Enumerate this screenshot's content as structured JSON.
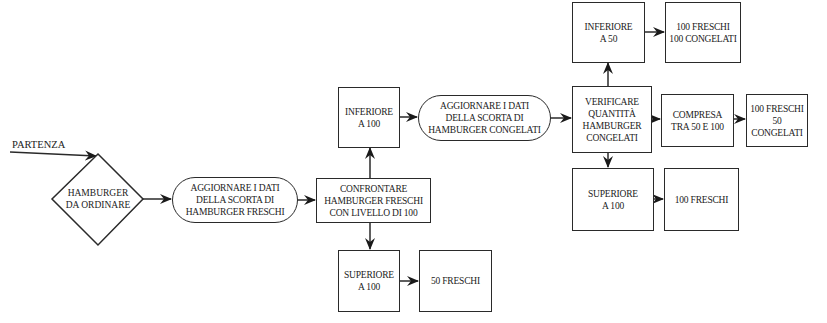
{
  "diagram": {
    "start_label": "PARTENZA",
    "nodes": {
      "decision_order": {
        "line1": "HAMBURGER",
        "line2": "DA ORDINARE"
      },
      "update_fresh": {
        "line1": "AGGIORNARE I DATI",
        "line2": "DELLA SCORTA DI",
        "line3": "HAMBURGER FRESCHI"
      },
      "compare_fresh": {
        "line1": "CONFRONTARE",
        "line2": "HAMBURGER FRESCHI",
        "line3": "CON LIVELLO DI 100"
      },
      "fresh_below_100": {
        "line1": "INFERIORE",
        "line2": "A 100"
      },
      "fresh_above_100": {
        "line1": "SUPERIORE",
        "line2": "A 100"
      },
      "order_50_fresh": {
        "line1": "50 FRESCHI"
      },
      "update_frozen": {
        "line1": "AGGIORNARE I DATI",
        "line2": "DELLA SCORTA DI",
        "line3": "HAMBURGER CONGELATI"
      },
      "check_frozen": {
        "line1": "VERIFICARE",
        "line2": "QUANTITÀ",
        "line3": "HAMBURGER",
        "line4": "CONGELATI"
      },
      "frozen_below_50": {
        "line1": "INFERIORE",
        "line2": "A 50"
      },
      "order_100f_100c": {
        "line1": "100 FRESCHI",
        "line2": "100 CONGELATI"
      },
      "frozen_between": {
        "line1": "COMPRESA",
        "line2": "TRA 50 E 100"
      },
      "order_100f_50c": {
        "line1": "100 FRESCHI",
        "line2": "50 CONGELATI"
      },
      "frozen_above_100": {
        "line1": "SUPERIORE",
        "line2": "A 100"
      },
      "order_100f": {
        "line1": "100 FRESCHI"
      }
    },
    "edges": [
      [
        "start",
        "decision_order"
      ],
      [
        "decision_order",
        "update_fresh"
      ],
      [
        "update_fresh",
        "compare_fresh"
      ],
      [
        "compare_fresh",
        "fresh_below_100"
      ],
      [
        "compare_fresh",
        "fresh_above_100"
      ],
      [
        "fresh_above_100",
        "order_50_fresh"
      ],
      [
        "fresh_below_100",
        "update_frozen"
      ],
      [
        "update_frozen",
        "check_frozen"
      ],
      [
        "check_frozen",
        "frozen_below_50"
      ],
      [
        "frozen_below_50",
        "order_100f_100c"
      ],
      [
        "check_frozen",
        "frozen_between"
      ],
      [
        "frozen_between",
        "order_100f_50c"
      ],
      [
        "check_frozen",
        "frozen_above_100"
      ],
      [
        "frozen_above_100",
        "order_100f"
      ]
    ]
  }
}
